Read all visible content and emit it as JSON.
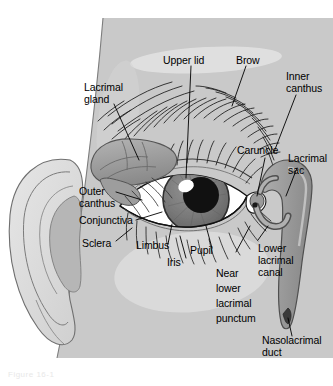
{
  "figure": {
    "background_color": "#ffffff",
    "skin_color": "#c9c9c9",
    "highlight_color": "#e3e3e3",
    "sclera_color": "#ffffff",
    "iris_color": "#7b7b7b",
    "pupil_color": "#111111",
    "outline_color": "#2b2b2b",
    "lacrimal_color": "#9b9b9b",
    "ear_color": "#dcdcdc",
    "caption_text": "Figure 16-1"
  },
  "labels": [
    {
      "id": "upper-lid",
      "text": "Upper lid",
      "lines": [
        "Upper lid"
      ]
    },
    {
      "id": "brow",
      "text": "Brow",
      "lines": [
        "Brow"
      ]
    },
    {
      "id": "inner-canthus",
      "text": "Inner canthus",
      "lines": [
        "Inner",
        "canthus"
      ]
    },
    {
      "id": "lacrimal-gland",
      "text": "Lacrimal gland",
      "lines": [
        "Lacrimal",
        "gland"
      ]
    },
    {
      "id": "caruncle",
      "text": "Caruncle",
      "lines": [
        "Caruncle"
      ]
    },
    {
      "id": "lacrimal-sac",
      "text": "Lacrimal sac",
      "lines": [
        "Lacrimal",
        "sac"
      ]
    },
    {
      "id": "outer-canthus",
      "text": "Outer canthus",
      "lines": [
        "Outer",
        "canthus"
      ]
    },
    {
      "id": "conjunctiva",
      "text": "Conjunctiva",
      "lines": [
        "Conjunctiva"
      ]
    },
    {
      "id": "sclera",
      "text": "Sclera",
      "lines": [
        "Sclera"
      ]
    },
    {
      "id": "limbus",
      "text": "Limbus",
      "lines": [
        "Limbus"
      ]
    },
    {
      "id": "iris",
      "text": "Iris",
      "lines": [
        "Iris"
      ]
    },
    {
      "id": "pupil",
      "text": "Pupil",
      "lines": [
        "Pupil"
      ]
    },
    {
      "id": "near-lower-lacrimal-punctum",
      "text": "Near lower lacrimal punctum",
      "lines": [
        "Near",
        "lower",
        "lacrimal",
        "punctum"
      ]
    },
    {
      "id": "lower-lacrimal-canal",
      "text": "Lower lacrimal canal",
      "lines": [
        "Lower",
        "lacrimal",
        "canal"
      ]
    },
    {
      "id": "nasolacrimal-duct",
      "text": "Nasolacrimal duct",
      "lines": [
        "Nasolacrimal",
        "duct"
      ]
    }
  ],
  "label_text": {
    "upper_lid": "Upper lid",
    "brow": "Brow",
    "inner_canthus_1": "Inner",
    "inner_canthus_2": "canthus",
    "lacrimal_gland_1": "Lacrimal",
    "lacrimal_gland_2": "gland",
    "caruncle": "Caruncle",
    "lacrimal_sac_1": "Lacrimal",
    "lacrimal_sac_2": "sac",
    "outer_canthus_1": "Outer",
    "outer_canthus_2": "canthus",
    "conjunctiva": "Conjunctiva",
    "sclera": "Sclera",
    "limbus": "Limbus",
    "iris": "Iris",
    "pupil": "Pupil",
    "near_1": "Near",
    "near_2": "lower",
    "near_3": "lacrimal",
    "near_4": "punctum",
    "lower_canal_1": "Lower",
    "lower_canal_2": "lacrimal",
    "lower_canal_3": "canal",
    "naso_1": "Nasolacrimal",
    "naso_2": "duct",
    "caption": "Figure 16-1"
  }
}
